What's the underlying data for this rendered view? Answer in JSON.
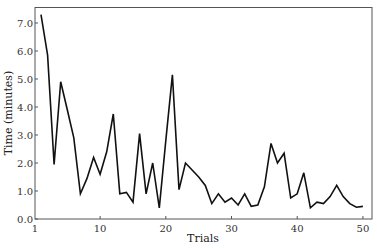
{
  "chart_data": {
    "type": "line",
    "title": "",
    "xlabel": "Trials",
    "ylabel": "Time (minutes)",
    "xlim": [
      0.9,
      51.5
    ],
    "ylim": [
      0.0,
      7.6
    ],
    "grid": false,
    "legend": null,
    "x_ticks": [
      1,
      10,
      20,
      30,
      40,
      50
    ],
    "x_tick_labels": [
      "1",
      "10",
      "20",
      "30",
      "40",
      "50"
    ],
    "y_ticks": [
      0,
      1,
      2,
      3,
      4,
      5,
      6,
      7
    ],
    "y_tick_labels": [
      "0.0",
      "1.0",
      "2.0",
      "3.0",
      "4.0",
      "5.0",
      "6.0",
      "7.0"
    ],
    "series": [
      {
        "name": "Time",
        "color": "#111111",
        "x": [
          1,
          2,
          3,
          4,
          5,
          6,
          7,
          8,
          9,
          10,
          11,
          12,
          13,
          14,
          15,
          16,
          17,
          18,
          19,
          20,
          21,
          22,
          23,
          24,
          25,
          26,
          27,
          28,
          29,
          30,
          31,
          32,
          33,
          34,
          35,
          36,
          37,
          38,
          39,
          40,
          41,
          42,
          43,
          44,
          45,
          46,
          47,
          48,
          49,
          50
        ],
        "values": [
          7.3,
          5.85,
          1.95,
          4.9,
          3.9,
          2.9,
          0.9,
          1.45,
          2.2,
          1.6,
          2.4,
          3.75,
          0.9,
          0.95,
          0.6,
          3.05,
          0.9,
          2.0,
          0.4,
          2.8,
          5.15,
          1.05,
          2.0,
          1.75,
          1.5,
          1.2,
          0.55,
          0.9,
          0.6,
          0.75,
          0.5,
          0.9,
          0.45,
          0.5,
          1.15,
          2.7,
          2.0,
          2.35,
          0.75,
          0.9,
          1.65,
          0.4,
          0.6,
          0.55,
          0.8,
          1.2,
          0.8,
          0.55,
          0.42,
          0.45
        ]
      }
    ]
  }
}
